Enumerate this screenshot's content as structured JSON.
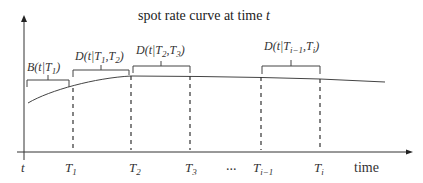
{
  "title": "spot rate curve at time t",
  "title_prefix": "spot rate curve at time ",
  "title_var": "t",
  "x_axis_label": "time",
  "ellipsis": "...",
  "origin_label": "t",
  "ticks": [
    {
      "base": "T",
      "sub": "1"
    },
    {
      "base": "T",
      "sub": "2"
    },
    {
      "base": "T",
      "sub": "3"
    },
    {
      "base": "T",
      "sub": "i−1"
    },
    {
      "base": "T",
      "sub": "i"
    }
  ],
  "braces": [
    {
      "label": "B(t|T1)",
      "fn": "B",
      "args_prefix": "t|T",
      "sub1": "1",
      "sep": "",
      "sub2": ""
    },
    {
      "label": "D(t|T1,T2)",
      "fn": "D",
      "args_prefix": "t|T",
      "sub1": "1",
      "sep": ",T",
      "sub2": "2"
    },
    {
      "label": "D(t|T2,T3)",
      "fn": "D",
      "args_prefix": "t|T",
      "sub1": "2",
      "sep": ",T",
      "sub2": "3"
    },
    {
      "label": "D(t|Ti−1,Ti)",
      "fn": "D",
      "args_prefix": "t|T",
      "sub1": "i−1",
      "sep": ",T",
      "sub2": "i"
    }
  ],
  "colors": {
    "axis": "#333333",
    "curve": "#444444",
    "dash": "#333333"
  }
}
